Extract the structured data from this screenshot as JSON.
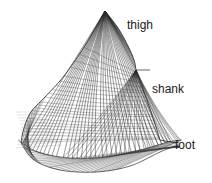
{
  "figure": {
    "width": 212,
    "height": 183,
    "background_color": "#ffffff",
    "line_color": "#2a2a2a",
    "line_color_light": "#6e6e6e"
  },
  "annotations": {
    "thigh": "thigh",
    "shank": "shank",
    "foot": "foot"
  },
  "chart_data": {
    "type": "line",
    "xlabel": "",
    "ylabel": "",
    "grid": false,
    "legend": "none",
    "xlim": [
      0,
      212
    ],
    "ylim": [
      0,
      183
    ],
    "annotations": [
      {
        "text": "thigh",
        "x": 127,
        "y": 26,
        "segment": "thigh"
      },
      {
        "text": "shank",
        "x": 152,
        "y": 90,
        "segment": "shank"
      },
      {
        "text": "foot",
        "x": 175,
        "y": 146,
        "segment": "foot"
      }
    ],
    "series": [
      {
        "name": "thigh-apex",
        "x": [
          105
        ],
        "y": [
          11
        ]
      },
      {
        "name": "knee-node",
        "x": [
          136
        ],
        "y": [
          70
        ]
      },
      {
        "name": "ankle-node",
        "x": [
          160
        ],
        "y": [
          140
        ]
      },
      {
        "name": "left-ridge",
        "x": [
          105,
          86,
          64,
          45,
          31,
          24,
          21
        ],
        "y": [
          11,
          44,
          76,
          97,
          112,
          128,
          143
        ]
      },
      {
        "name": "right-ridge",
        "x": [
          105,
          118,
          128,
          134,
          136
        ],
        "y": [
          11,
          28,
          46,
          60,
          70
        ]
      },
      {
        "name": "shank-ridge",
        "x": [
          136,
          143,
          150,
          156,
          160
        ],
        "y": [
          70,
          89,
          109,
          127,
          140
        ]
      },
      {
        "name": "foot-outline",
        "x": [
          21,
          34,
          60,
          96,
          130,
          160,
          178
        ],
        "y": [
          143,
          160,
          170,
          172,
          166,
          152,
          145
        ]
      },
      {
        "name": "base-curve",
        "x": [
          18,
          38,
          70,
          105,
          140,
          168,
          182
        ],
        "y": [
          140,
          152,
          158,
          157,
          150,
          142,
          140
        ]
      }
    ],
    "mesh_params": {
      "apex": [
        105,
        11
      ],
      "knee": [
        136,
        70
      ],
      "ankle": [
        160,
        140
      ],
      "heel": [
        22,
        152
      ],
      "toe": [
        180,
        144
      ],
      "fan_lines": 34,
      "rib_lines": 28,
      "cross_lines": 22
    }
  }
}
